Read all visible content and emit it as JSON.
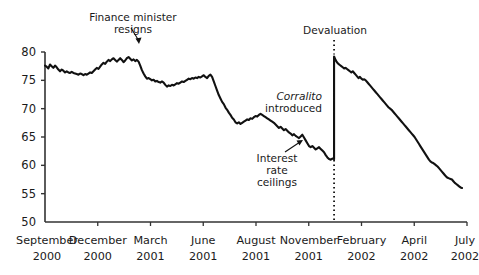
{
  "chart_data": {
    "type": "line",
    "title": "",
    "subtitle": "",
    "xlabel": "",
    "ylabel": "",
    "ylim": [
      50,
      80
    ],
    "xlim": [
      0,
      100
    ],
    "grid": false,
    "legend": "none",
    "series_color": "#111111",
    "yticks": [
      50,
      55,
      60,
      65,
      70,
      75,
      80
    ],
    "ytick_labels": [
      "50",
      "55",
      "60",
      "65",
      "70",
      "75",
      "80"
    ],
    "xtick_positions": [
      0,
      14.3,
      28.6,
      42.9,
      57.1,
      71.4,
      85.7,
      100
    ],
    "xtick_labels": [
      {
        "month": "September",
        "year": "2000"
      },
      {
        "month": "December",
        "year": "2000"
      },
      {
        "month": "March",
        "year": "2001"
      },
      {
        "month": "June",
        "year": "2001"
      },
      {
        "month": "August",
        "year": "2001"
      },
      {
        "month": "November",
        "year": "2001"
      },
      {
        "month": "February",
        "year": "2002"
      },
      {
        "month": "April",
        "year": "2002"
      },
      {
        "month": "July",
        "year": "2002"
      }
    ],
    "series": [
      {
        "name": "deposits-index",
        "values": [
          77.6,
          77.4,
          77.1,
          77.8,
          77.5,
          77.2,
          77.6,
          77.3,
          76.9,
          76.6,
          76.9,
          76.7,
          76.4,
          76.6,
          76.4,
          76.3,
          76.5,
          76.3,
          76.2,
          76.1,
          76.0,
          76.2,
          76.1,
          75.9,
          76.1,
          76.0,
          76.2,
          76.4,
          76.3,
          76.6,
          76.9,
          77.2,
          77.0,
          77.4,
          77.8,
          78.1,
          77.9,
          78.3,
          78.6,
          78.4,
          78.7,
          78.9,
          78.6,
          78.3,
          78.6,
          78.9,
          78.6,
          78.2,
          78.5,
          78.9,
          79.1,
          78.8,
          78.5,
          78.7,
          78.4,
          78.6,
          78.3,
          77.6,
          76.8,
          76.2,
          75.7,
          75.3,
          75.4,
          75.2,
          75.0,
          75.1,
          74.8,
          74.9,
          74.7,
          74.6,
          74.8,
          74.6,
          74.2,
          73.9,
          74.1,
          74.0,
          74.2,
          74.1,
          74.3,
          74.5,
          74.4,
          74.6,
          74.8,
          74.7,
          74.9,
          75.1,
          75.3,
          75.2,
          75.4,
          75.3,
          75.5,
          75.4,
          75.6,
          75.5,
          75.7,
          75.9,
          75.6,
          75.4,
          75.8,
          76.0,
          75.6,
          74.8,
          74.0,
          73.2,
          72.4,
          71.8,
          71.2,
          70.8,
          70.2,
          69.8,
          69.3,
          68.9,
          68.4,
          68.1,
          67.6,
          67.4,
          67.6,
          67.3,
          67.5,
          67.7,
          67.9,
          68.1,
          68.0,
          68.3,
          68.2,
          68.5,
          68.7,
          68.6,
          68.9,
          69.1,
          68.9,
          68.7,
          68.5,
          68.3,
          68.1,
          67.9,
          67.7,
          67.5,
          67.2,
          66.9,
          66.6,
          66.8,
          66.5,
          66.2,
          66.4,
          66.1,
          65.8,
          65.6,
          65.3,
          65.5,
          65.2,
          65.0,
          64.8,
          65.1,
          65.4,
          64.9,
          64.4,
          63.9,
          63.4,
          63.2,
          63.4,
          63.1,
          62.8,
          63.0,
          63.2,
          62.9,
          62.6,
          62.3,
          61.8,
          61.4,
          61.1,
          61.0,
          61.2,
          61.1,
          79.2,
          78.6,
          78.2,
          77.9,
          77.7,
          77.5,
          77.3,
          77.1,
          77.2,
          77.0,
          76.8,
          76.6,
          76.4,
          76.6,
          76.3,
          76.0,
          75.7,
          75.4,
          75.6,
          75.3,
          75.1,
          75.2,
          75.0,
          74.7,
          74.4,
          74.1,
          73.8,
          73.5,
          73.2,
          72.9,
          72.6,
          72.3,
          72.0,
          71.7,
          71.4,
          71.1,
          70.8,
          70.5,
          70.2,
          70.0,
          69.8,
          69.5,
          69.2,
          68.9,
          68.6,
          68.3,
          68.0,
          67.7,
          67.4,
          67.1,
          66.8,
          66.5,
          66.2,
          65.9,
          65.6,
          65.3,
          65.0,
          64.6,
          64.2,
          63.8,
          63.4,
          63.0,
          62.6,
          62.2,
          61.8,
          61.4,
          61.0,
          60.7,
          60.5,
          60.4,
          60.2,
          60.0,
          59.8,
          59.5,
          59.2,
          58.9,
          58.6,
          58.3,
          58.0,
          57.8,
          57.7,
          57.6,
          57.5,
          57.2,
          56.9,
          56.7,
          56.5,
          56.3,
          56.1,
          56.0
        ]
      }
    ],
    "event_line": {
      "label": "Devaluation",
      "x_position": 68.5,
      "style": "dotted"
    },
    "jump": {
      "from": 61.1,
      "to": 79.2,
      "x_position": 68.5
    },
    "annotations": [
      {
        "name": "finance-minister-resigns",
        "lines": [
          "Finance minister",
          "resigns"
        ],
        "italic_first_word": false,
        "arrow": "down-right"
      },
      {
        "name": "corralito-introduced",
        "lines": [
          "Corralito",
          "introduced"
        ],
        "italic_first_word": true,
        "arrow": "none"
      },
      {
        "name": "interest-rate-ceilings",
        "lines": [
          "Interest",
          "rate",
          "ceilings"
        ],
        "italic_first_word": false,
        "arrow": "up-right"
      }
    ]
  }
}
